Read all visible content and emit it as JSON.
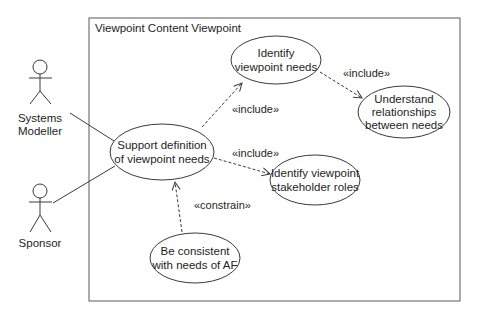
{
  "diagram": {
    "type": "UML use case diagram",
    "system_boundary": {
      "title": "Viewpoint Content Viewpoint"
    },
    "actors": [
      {
        "id": "systems-modeller",
        "label_lines": [
          "Systems",
          "Modeller"
        ]
      },
      {
        "id": "sponsor",
        "label_lines": [
          "Sponsor"
        ]
      }
    ],
    "use_cases": [
      {
        "id": "support-definition",
        "label_lines": [
          "Support definition",
          "of viewpoint needs"
        ]
      },
      {
        "id": "identify-needs",
        "label_lines": [
          "Identify",
          "viewpoint needs"
        ]
      },
      {
        "id": "understand-relationships",
        "label_lines": [
          "Understand",
          "relationships",
          "between needs"
        ]
      },
      {
        "id": "identify-stakeholder-roles",
        "label_lines": [
          "Identify viewpoint",
          "stakeholder roles"
        ]
      },
      {
        "id": "be-consistent",
        "label_lines": [
          "Be consistent",
          "with needs of AF"
        ]
      }
    ],
    "relationships": [
      {
        "from": "systems-modeller",
        "to": "support-definition",
        "kind": "association"
      },
      {
        "from": "sponsor",
        "to": "support-definition",
        "kind": "association"
      },
      {
        "from": "support-definition",
        "to": "identify-needs",
        "kind": "dependency",
        "stereotype": "«include»"
      },
      {
        "from": "identify-needs",
        "to": "understand-relationships",
        "kind": "dependency",
        "stereotype": "«include»"
      },
      {
        "from": "support-definition",
        "to": "identify-stakeholder-roles",
        "kind": "dependency",
        "stereotype": "«include»"
      },
      {
        "from": "be-consistent",
        "to": "support-definition",
        "kind": "dependency",
        "stereotype": "«constrain»"
      }
    ]
  },
  "colors": {
    "line": "#3a3a3a",
    "text": "#1e1e1e",
    "frame": "#5a5a5a",
    "background": "#ffffff"
  }
}
